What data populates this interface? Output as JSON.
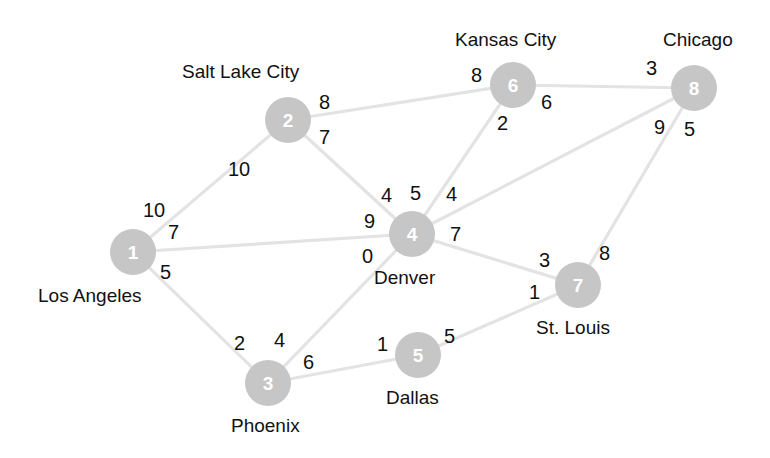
{
  "diagram": {
    "node_fill": "#c6c6c6",
    "node_text_color": "#ffffff",
    "edge_color": "#e3e3e3",
    "label_color": "#111111",
    "background": "#ffffff"
  },
  "nodes": [
    {
      "id": "1",
      "name": "Los Angeles",
      "cx": 133,
      "cy": 252,
      "r": 23,
      "label_x": 38,
      "label_y": 286
    },
    {
      "id": "2",
      "name": "Salt Lake City",
      "cx": 288,
      "cy": 120,
      "r": 23,
      "label_x": 182,
      "label_y": 62
    },
    {
      "id": "3",
      "name": "Phoenix",
      "cx": 268,
      "cy": 383,
      "r": 23,
      "label_x": 231,
      "label_y": 416
    },
    {
      "id": "4",
      "name": "Denver",
      "cx": 412,
      "cy": 234,
      "r": 23,
      "label_x": 374,
      "label_y": 268
    },
    {
      "id": "5",
      "name": "Dallas",
      "cx": 418,
      "cy": 355,
      "r": 23,
      "label_x": 386,
      "label_y": 388
    },
    {
      "id": "6",
      "name": "Kansas City",
      "cx": 513,
      "cy": 85,
      "r": 23,
      "label_x": 455,
      "label_y": 30
    },
    {
      "id": "7",
      "name": "St. Louis",
      "cx": 578,
      "cy": 285,
      "r": 23,
      "label_x": 536,
      "label_y": 318
    },
    {
      "id": "8",
      "name": "Chicago",
      "cx": 694,
      "cy": 88,
      "r": 23,
      "label_x": 663,
      "label_y": 30
    }
  ],
  "edges": [
    {
      "from": "1",
      "to": "2",
      "x1": 133,
      "y1": 252,
      "x2": 288,
      "y2": 120,
      "w_from": "10",
      "w_from_x": 143,
      "w_from_y": 200,
      "w_to": "10",
      "w_to_x": 228,
      "w_to_y": 159
    },
    {
      "from": "1",
      "to": "4",
      "x1": 133,
      "y1": 252,
      "x2": 412,
      "y2": 234,
      "w_from": "7",
      "w_from_x": 168,
      "w_from_y": 222,
      "w_to": "9",
      "w_to_x": 364,
      "w_to_y": 211
    },
    {
      "from": "1",
      "to": "3",
      "x1": 133,
      "y1": 252,
      "x2": 268,
      "y2": 383,
      "w_from": "5",
      "w_from_x": 160,
      "w_from_y": 262,
      "w_to": "2",
      "w_to_x": 234,
      "w_to_y": 333
    },
    {
      "from": "2",
      "to": "4",
      "x1": 288,
      "y1": 120,
      "x2": 412,
      "y2": 234,
      "w_from": "7",
      "w_from_x": 319,
      "w_from_y": 127,
      "w_to": "4",
      "w_to_x": 381,
      "w_to_y": 185
    },
    {
      "from": "2",
      "to": "6",
      "x1": 288,
      "y1": 120,
      "x2": 513,
      "y2": 85,
      "w_from": "8",
      "w_from_x": 319,
      "w_from_y": 92,
      "w_to": "8",
      "w_to_x": 471,
      "w_to_y": 65
    },
    {
      "from": "3",
      "to": "4",
      "x1": 268,
      "y1": 383,
      "x2": 412,
      "y2": 234,
      "w_from": "4",
      "w_from_x": 274,
      "w_from_y": 330,
      "w_to": "0",
      "w_to_x": 362,
      "w_to_y": 246
    },
    {
      "from": "3",
      "to": "5",
      "x1": 268,
      "y1": 383,
      "x2": 418,
      "y2": 355,
      "w_from": "6",
      "w_from_x": 303,
      "w_from_y": 352,
      "w_to": "1",
      "w_to_x": 377,
      "w_to_y": 334
    },
    {
      "from": "4",
      "to": "6",
      "x1": 412,
      "y1": 234,
      "x2": 513,
      "y2": 85,
      "w_from": "5",
      "w_from_x": 410,
      "w_from_y": 183,
      "w_to": "2",
      "w_to_x": 497,
      "w_to_y": 113
    },
    {
      "from": "4",
      "to": "8",
      "x1": 412,
      "y1": 234,
      "x2": 694,
      "y2": 88,
      "w_from": "4",
      "w_from_x": 446,
      "w_from_y": 184,
      "w_to": "9",
      "w_to_x": 654,
      "w_to_y": 117
    },
    {
      "from": "4",
      "to": "7",
      "x1": 412,
      "y1": 234,
      "x2": 578,
      "y2": 285,
      "w_from": "7",
      "w_from_x": 450,
      "w_from_y": 224,
      "w_to": "3",
      "w_to_x": 539,
      "w_to_y": 250
    },
    {
      "from": "5",
      "to": "7",
      "x1": 418,
      "y1": 355,
      "x2": 578,
      "y2": 285,
      "w_from": "5",
      "w_from_x": 444,
      "w_from_y": 326,
      "w_to": "1",
      "w_to_x": 529,
      "w_to_y": 282
    },
    {
      "from": "6",
      "to": "8",
      "x1": 513,
      "y1": 85,
      "x2": 694,
      "y2": 88,
      "w_from": "6",
      "w_from_x": 541,
      "w_from_y": 92,
      "w_to": "3",
      "w_to_x": 646,
      "w_to_y": 58
    },
    {
      "from": "7",
      "to": "8",
      "x1": 578,
      "y1": 285,
      "x2": 694,
      "y2": 88,
      "w_from": "8",
      "w_from_x": 599,
      "w_from_y": 243,
      "w_to": "5",
      "w_to_x": 684,
      "w_to_y": 119
    }
  ]
}
